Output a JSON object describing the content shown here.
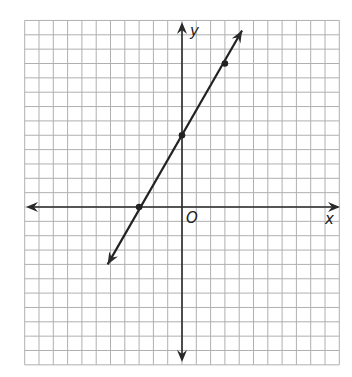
{
  "chart_data": {
    "type": "line",
    "title": "",
    "xlabel": "x",
    "ylabel": "y",
    "origin_label": "O",
    "grid": true,
    "xlim": [
      -11,
      11
    ],
    "ylim": [
      -11,
      13
    ],
    "series": [
      {
        "name": "line",
        "equation": "y = (5/3)x + 5",
        "slope": 1.6667,
        "intercept": 5,
        "points": [
          {
            "x": -3,
            "y": 0
          },
          {
            "x": 0,
            "y": 5
          },
          {
            "x": 3,
            "y": 10
          }
        ],
        "arrow_ends": [
          {
            "x": -5.2,
            "y": -4.0
          },
          {
            "x": 4.2,
            "y": 12.3
          }
        ]
      }
    ]
  },
  "colors": {
    "grid": "#b0b0b0",
    "axis": "#2a2a2a",
    "line": "#222222",
    "background": "#ffffff"
  }
}
